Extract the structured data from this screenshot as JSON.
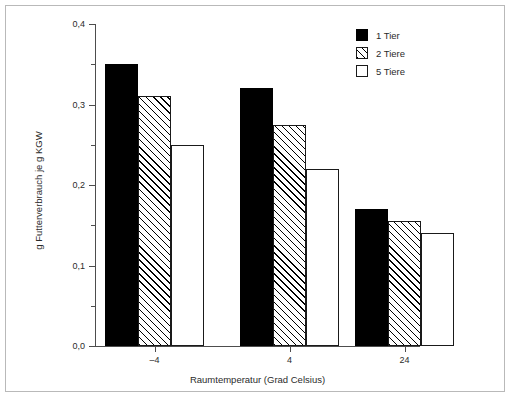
{
  "chart_data": {
    "type": "bar",
    "title": "",
    "xlabel": "Raumtemperatur (Grad Celsius)",
    "ylabel": "g Futterverbrauch je g KGW",
    "categories": [
      "-4",
      "4",
      "24"
    ],
    "series": [
      {
        "name": "1 Tier",
        "fill": "solid",
        "values": [
          0.35,
          0.32,
          0.17
        ]
      },
      {
        "name": "2 Tiere",
        "fill": "hatch",
        "values": [
          0.31,
          0.275,
          0.155
        ]
      },
      {
        "name": "5 Tiere",
        "fill": "open",
        "values": [
          0.25,
          0.22,
          0.14
        ]
      }
    ],
    "ylim": [
      0.0,
      0.4
    ],
    "ytick_labels": [
      "0,0",
      "0,1",
      "0,2",
      "0,3",
      "0,4"
    ],
    "ytick_values": [
      0.0,
      0.1,
      0.2,
      0.3,
      0.4
    ],
    "yminor_values": [
      0.05,
      0.15,
      0.25,
      0.35
    ],
    "grid": false,
    "legend_position": "top-right",
    "colors": {
      "axis": "#4d4d4d",
      "text": "#2b2b2b",
      "bar_edge": "#1a1a1a",
      "series_1": "#000000",
      "series_2": "#ffffff",
      "series_3": "#ffffff",
      "frame": "#b9b9b9"
    }
  },
  "legend": {
    "items": [
      {
        "label": "1 Tier"
      },
      {
        "label": "2 Tiere"
      },
      {
        "label": "5 Tiere"
      }
    ]
  }
}
